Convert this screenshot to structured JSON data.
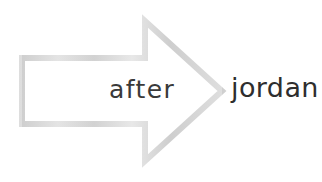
{
  "canvas": {
    "width": 322,
    "height": 182,
    "background_color": "#ffffff"
  },
  "graphic": {
    "name": "right-pointing-arrow",
    "style": "hollow outline",
    "stroke_color": "#d4d4d4",
    "stroke_highlight_color": "#e6e6e6",
    "stroke_shadow_color": "#c4c4c4",
    "fill_color": "#ffffff",
    "stroke_width_px": 6,
    "direction": "right",
    "outline_points": "22,58 145,58 145,21 222,91 145,161 145,124 22,124",
    "tip_x": 222,
    "tip_y": 91
  },
  "text": {
    "after_label": "after",
    "after_color": "#3a3a3a",
    "jordan_label": "jordan",
    "jordan_color": "#2e2e2e"
  }
}
